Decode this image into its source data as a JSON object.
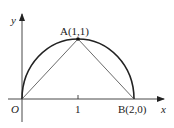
{
  "diagram": {
    "type": "coordinate-geometry",
    "axes": {
      "x_label": "x",
      "y_label": "y",
      "origin_label": "O",
      "tick_labels": [
        "1"
      ]
    },
    "points": [
      {
        "name": "A",
        "label": "A(1,1)",
        "x": 1,
        "y": 1
      },
      {
        "name": "B",
        "label": "B(2,0)",
        "x": 2,
        "y": 0
      },
      {
        "name": "O",
        "label": "O",
        "x": 0,
        "y": 0
      }
    ],
    "curves": [
      {
        "type": "semicircle",
        "center": [
          1,
          0
        ],
        "radius": 1,
        "from": "O",
        "to": "B",
        "through": "A"
      }
    ],
    "segments": [
      [
        "O",
        "A"
      ],
      [
        "A",
        "B"
      ]
    ],
    "colors": {
      "stroke": "#222222",
      "axis": "#333333",
      "background": "#ffffff"
    }
  }
}
